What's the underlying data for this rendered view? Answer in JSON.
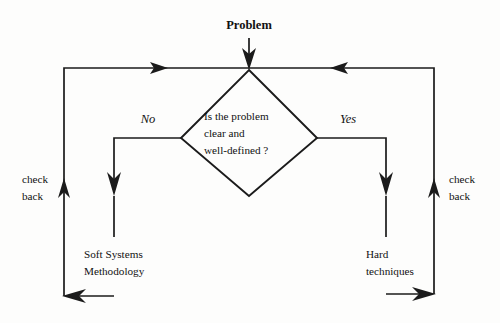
{
  "diagram": {
    "type": "flowchart",
    "title_label": "Problem",
    "decision": {
      "name": "problem-clarity-decision",
      "lines": [
        "Is the problem",
        "clear and",
        "well-defined ?"
      ]
    },
    "branches": {
      "no_label": "No",
      "yes_label": "Yes"
    },
    "outcomes": {
      "left": {
        "lines": [
          "Soft Systems",
          "Methodology"
        ]
      },
      "right": {
        "lines": [
          "Hard",
          "techniques"
        ]
      }
    },
    "feedback": {
      "left_label_lines": [
        "check",
        "back"
      ],
      "right_label_lines": [
        "check",
        "back"
      ]
    },
    "colors": {
      "ink": "#1b1b1b",
      "background": "#fdfdfc",
      "text": "#111111"
    }
  }
}
